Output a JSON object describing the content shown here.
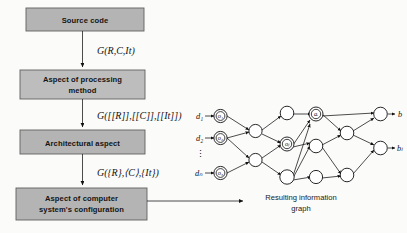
{
  "diagram": {
    "colors": {
      "box_fill": "#b4b4b4",
      "box_fill_light": "#bdbdbd",
      "box_border": "#5f5f5f",
      "line": "#111111",
      "background": "#fbfbfa",
      "node_fill": "#ffffff"
    },
    "flow_boxes": [
      {
        "id": "source-code",
        "label": "Source code",
        "lines": [
          "Source code"
        ],
        "x": 26,
        "y": 8,
        "w": 118,
        "h": 23
      },
      {
        "id": "aspect-processing-method",
        "label": "Aspect of processing method",
        "lines": [
          "Aspect of processing",
          "method"
        ],
        "x": 20,
        "y": 70,
        "w": 125,
        "h": 29
      },
      {
        "id": "architectural-aspect",
        "label": "Architectural aspect",
        "lines": [
          "Architectural aspect"
        ],
        "x": 20,
        "y": 130,
        "w": 125,
        "h": 24
      },
      {
        "id": "aspect-computer-system-configuration",
        "label": "Aspect of computer system's configuration",
        "lines": [
          "Aspect of computer",
          "system's configuration"
        ],
        "x": 16,
        "y": 188,
        "w": 131,
        "h": 32
      }
    ],
    "formulas": [
      {
        "id": "formula-1",
        "text": "G(R,C,It)",
        "x": 97,
        "y": 54
      },
      {
        "id": "formula-2",
        "text": "G([[R]],[[C]],[[It]])",
        "x": 97,
        "y": 119
      },
      {
        "id": "formula-3",
        "text": "G({R},⟨C⟩,{It})",
        "x": 97,
        "y": 176
      }
    ],
    "graph": {
      "caption": "Resulting information graph",
      "caption_lines": [
        "Resulting information",
        "graph"
      ],
      "inputs": [
        {
          "id": "input-d1",
          "label": "d₁",
          "node_label": "o₁"
        },
        {
          "id": "input-d2",
          "label": "d₂",
          "node_label": "o₂"
        },
        {
          "id": "input-dN",
          "label": "dₙ",
          "node_label": "o₃"
        }
      ],
      "vertical_ellipsis": "⋮",
      "inner_node_labels": [
        "oⱼ",
        "aᵢ"
      ],
      "outputs": [
        {
          "id": "output-b",
          "label": "b"
        },
        {
          "id": "output-bL",
          "label": "bₗ"
        }
      ],
      "layer_counts": [
        3,
        2,
        3,
        3,
        2
      ]
    }
  }
}
